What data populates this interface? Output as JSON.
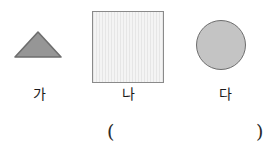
{
  "page": {
    "background_color": "#ffffff",
    "width": 269,
    "height": 153
  },
  "figures": [
    {
      "id": "triangle",
      "icon": "triangle-shape",
      "label": "가",
      "fill_color": "#969696",
      "stroke_color": "#6e6e6e"
    },
    {
      "id": "square",
      "icon": "square-shape",
      "label": "나",
      "fill_color": "#ededed",
      "stroke_color": "#8a8a8a"
    },
    {
      "id": "circle",
      "icon": "circle-shape",
      "label": "다",
      "fill_color": "#c4c4c4",
      "stroke_color": "#6e6e6e"
    }
  ],
  "answer": {
    "open_paren": "(",
    "close_paren": ")",
    "value": ""
  }
}
